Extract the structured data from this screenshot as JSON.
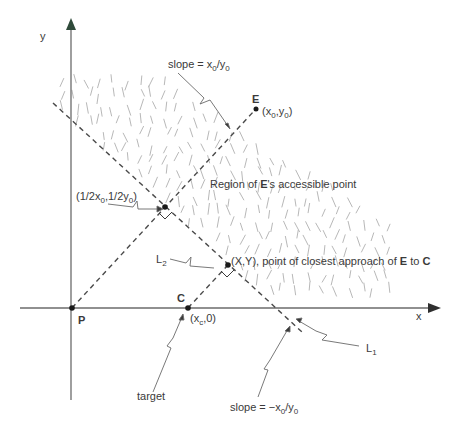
{
  "diagram": {
    "title": "",
    "colors": {
      "axis": "#6b6b6b",
      "arrow_head": "#2f2f2f",
      "dashed_line": "#4a4a4a",
      "hatch": "#b8b8b8",
      "text": "#3a3a3a",
      "point": "#1a1a1a",
      "leader": "#6a6a6a"
    },
    "axes": {
      "x_label": "x",
      "y_label": "y"
    },
    "points": {
      "P": {
        "label": "P"
      },
      "C": {
        "label": "C",
        "coord_main": "(x",
        "coord_sub": "c",
        "coord_tail": ",0)"
      },
      "E": {
        "label": "E",
        "coord_a": "(x",
        "coord_a_sub": "0",
        "coord_b": ",y",
        "coord_b_sub": "0",
        "coord_tail": ")"
      },
      "midpoint": {
        "a": "(1/2x",
        "a_sub": "0",
        "b": ",1/2y",
        "b_sub": "0",
        "tail": ")"
      },
      "closest": {
        "text_pre": "(X,Y), point of closest approach of ",
        "E": "E",
        "mid": " to ",
        "C": "C"
      }
    },
    "region_label": {
      "pre": "Region of ",
      "E": "E",
      "post": "'s accessible point"
    },
    "lines": {
      "L1": {
        "label": "L",
        "sub": "1"
      },
      "L2": {
        "label": "L",
        "sub": "2"
      }
    },
    "annotations": {
      "slope_pos": {
        "pre": "slope = x",
        "sub1": "0",
        "mid": "/y",
        "sub2": "0"
      },
      "slope_neg": {
        "pre": "slope = −x",
        "sub1": "0",
        "mid": "/y",
        "sub2": "0"
      },
      "target": "target"
    }
  }
}
